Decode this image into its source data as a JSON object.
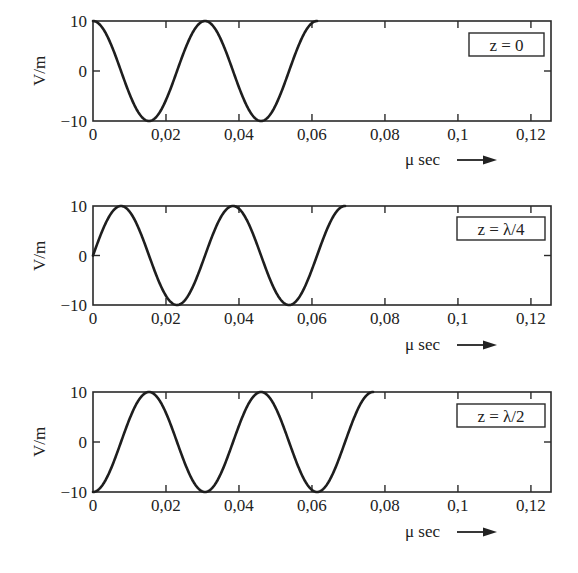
{
  "chart_data": [
    {
      "type": "line",
      "title": "",
      "legend": "z = 0",
      "xlabel": "μ sec",
      "ylabel": "V/m",
      "xlim": [
        0,
        0.1255
      ],
      "ylim": [
        -10,
        10
      ],
      "xticks": [
        0,
        0.02,
        0.04,
        0.06,
        0.08,
        0.1,
        0.12
      ],
      "xtick_labels": [
        "0",
        "0,02",
        "0,04",
        "0,06",
        "0,08",
        "0,1",
        "0,12"
      ],
      "yticks": [
        -10,
        0,
        10
      ],
      "ytick_labels": [
        "−10",
        "0",
        "10"
      ],
      "grid": false,
      "legend_position": "upper right",
      "series": [
        {
          "name": "E(t) at z = 0",
          "function": "10*cos(2*pi*(t - 0)/0.0307)",
          "amplitude": 10,
          "period": 0.0307,
          "delay": 0,
          "t_end": 0.0614,
          "x": [
            0,
            0.00768,
            0.01535,
            0.02303,
            0.0307,
            0.03838,
            0.04605,
            0.05373,
            0.0614
          ],
          "y": [
            10,
            0,
            -10,
            0,
            10,
            0,
            -10,
            0,
            10
          ]
        }
      ]
    },
    {
      "type": "line",
      "title": "",
      "legend": "z = λ/4",
      "xlabel": "μ sec",
      "ylabel": "V/m",
      "xlim": [
        0,
        0.1255
      ],
      "ylim": [
        -10,
        10
      ],
      "xticks": [
        0,
        0.02,
        0.04,
        0.06,
        0.08,
        0.1,
        0.12
      ],
      "xtick_labels": [
        "0",
        "0,02",
        "0,04",
        "0,06",
        "0,08",
        "0,1",
        "0,12"
      ],
      "yticks": [
        -10,
        0,
        10
      ],
      "ytick_labels": [
        "−10",
        "0",
        "10"
      ],
      "grid": false,
      "legend_position": "upper right",
      "series": [
        {
          "name": "E(t) at z = λ/4",
          "function": "10*cos(2*pi*(t - 0.007675)/0.0307)",
          "amplitude": 10,
          "period": 0.0307,
          "delay": 0.007675,
          "t_end": 0.069075,
          "x": [
            0,
            0.00768,
            0.01535,
            0.02303,
            0.0307,
            0.03838,
            0.04605,
            0.05373,
            0.0614,
            0.06908
          ],
          "y": [
            0,
            10,
            0,
            -10,
            0,
            10,
            0,
            -10,
            0,
            10
          ]
        }
      ]
    },
    {
      "type": "line",
      "title": "",
      "legend": "z = λ/2",
      "xlabel": "μ sec",
      "ylabel": "V/m",
      "xlim": [
        0,
        0.1255
      ],
      "ylim": [
        -10,
        10
      ],
      "xticks": [
        0,
        0.02,
        0.04,
        0.06,
        0.08,
        0.1,
        0.12
      ],
      "xtick_labels": [
        "0",
        "0,02",
        "0,04",
        "0,06",
        "0,08",
        "0,1",
        "0,12"
      ],
      "yticks": [
        -10,
        0,
        10
      ],
      "ytick_labels": [
        "−10",
        "0",
        "10"
      ],
      "grid": false,
      "legend_position": "upper right",
      "series": [
        {
          "name": "E(t) at z = λ/2",
          "function": "10*cos(2*pi*(t - 0.01535)/0.0307)",
          "amplitude": 10,
          "period": 0.0307,
          "delay": 0.01535,
          "t_end": 0.07675,
          "x": [
            0,
            0.00768,
            0.01535,
            0.02303,
            0.0307,
            0.03838,
            0.04605,
            0.05373,
            0.0614,
            0.06908,
            0.07675
          ],
          "y": [
            -10,
            0,
            10,
            0,
            -10,
            0,
            10,
            0,
            -10,
            0,
            10
          ]
        }
      ]
    }
  ],
  "layout": {
    "panels": [
      {
        "plot_left": 93,
        "plot_right": 551,
        "plot_top": 21,
        "plot_bottom": 121,
        "legend_box": {
          "x": 469,
          "y": 33,
          "w": 75,
          "h": 23
        },
        "ylabel_center": {
          "x": 40,
          "y": 71
        },
        "xtitle_baseline_y": 165
      },
      {
        "plot_left": 93,
        "plot_right": 551,
        "plot_top": 206,
        "plot_bottom": 305,
        "legend_box": {
          "x": 457,
          "y": 217,
          "w": 88,
          "h": 23
        },
        "ylabel_center": {
          "x": 40,
          "y": 256
        },
        "xtitle_baseline_y": 350
      },
      {
        "plot_left": 93,
        "plot_right": 551,
        "plot_top": 392,
        "plot_bottom": 492,
        "legend_box": {
          "x": 457,
          "y": 404,
          "w": 88,
          "h": 23
        },
        "ylabel_center": {
          "x": 40,
          "y": 442
        },
        "xtitle_baseline_y": 537
      }
    ],
    "xtitle_x": 405,
    "arrow": {
      "x1": 457,
      "x2": 497
    }
  },
  "figure": {
    "x_axis_title": "μ sec",
    "y_axis_title": "V/m",
    "arrow_symbol": "→"
  }
}
